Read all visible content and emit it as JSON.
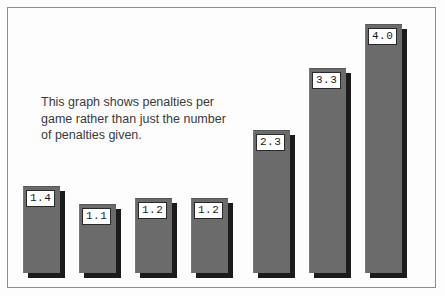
{
  "chart_data": {
    "type": "bar",
    "title": "",
    "subtitle": "",
    "xlabel": "",
    "ylabel": "",
    "categories": [
      "",
      "",
      "",
      "",
      "",
      "",
      ""
    ],
    "values": [
      1.4,
      1.1,
      1.2,
      1.2,
      2.3,
      3.3,
      4.0
    ],
    "data_labels": [
      "1.4",
      "1.1",
      "1.2",
      "1.2",
      "2.3",
      "3.3",
      "4.0"
    ],
    "ylim": [
      0,
      4.0
    ],
    "grid": false,
    "legend": false,
    "legend_position": "none",
    "annotations": [
      "This graph shows penalties per",
      "game rather than just the number",
      "of penalties given."
    ],
    "annotation_text": "This graph shows penalties per game rather than just the number of penalties given.",
    "colors": {
      "bar_fill": "#6b6b6b",
      "bar_shadow": "#1b1b1b",
      "label_background": "#ffffff",
      "label_border": "#2a2a2a",
      "label_text": "#1a1a1a",
      "frame_border": "#8d8d8d",
      "background": "#fdfdfd",
      "annotation_text": "#3a3a3a"
    },
    "bars": [
      {
        "label": "1.4",
        "value": 1.4,
        "left": 15,
        "width": 37,
        "height": 87
      },
      {
        "label": "1.1",
        "value": 1.1,
        "left": 71,
        "width": 37,
        "height": 69
      },
      {
        "label": "1.2",
        "value": 1.2,
        "left": 127,
        "width": 37,
        "height": 75
      },
      {
        "label": "1.2",
        "value": 1.2,
        "left": 183,
        "width": 37,
        "height": 75
      },
      {
        "label": "2.3",
        "value": 2.3,
        "left": 245,
        "width": 37,
        "height": 143
      },
      {
        "label": "3.3",
        "value": 3.3,
        "left": 301,
        "width": 37,
        "height": 205
      },
      {
        "label": "4.0",
        "value": 4.0,
        "left": 357,
        "width": 37,
        "height": 249
      }
    ]
  }
}
